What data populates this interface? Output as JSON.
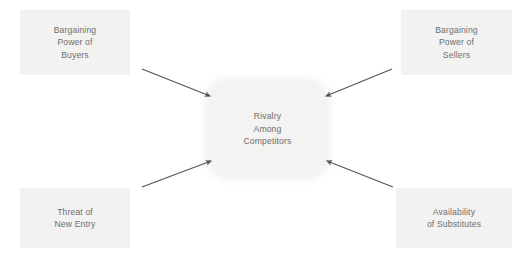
{
  "diagram": {
    "type": "porters-five-forces",
    "canvas": {
      "width": 532,
      "height": 255,
      "background": "#ffffff"
    },
    "colors": {
      "box_fill": "#f2f2f1",
      "center_fill": "#f3f3f2",
      "text": "#6e6e6e",
      "arrow": "#575757"
    },
    "center": {
      "label": "Rivalry\nAmong\nCompetitors"
    },
    "forces": [
      {
        "id": "bargaining-power-of-buyers",
        "label": "Bargaining\nPower of\nBuyers",
        "position": "top-left"
      },
      {
        "id": "bargaining-power-of-sellers",
        "label": "Bargaining\nPower of\nSellers",
        "position": "top-right"
      },
      {
        "id": "threat-of-new-entry",
        "label": "Threat of\nNew Entry",
        "position": "bottom-left"
      },
      {
        "id": "availability-of-substitutes",
        "label": "Availability\nof Substitutes",
        "position": "bottom-right"
      }
    ],
    "connectors": [
      {
        "id": "arrow-buyers-to-rivalry",
        "from": "bargaining-power-of-buyers",
        "to": "center",
        "direction": "down-right"
      },
      {
        "id": "arrow-sellers-to-rivalry",
        "from": "bargaining-power-of-sellers",
        "to": "center",
        "direction": "down-left"
      },
      {
        "id": "arrow-entry-to-rivalry",
        "from": "threat-of-new-entry",
        "to": "center",
        "direction": "up-right"
      },
      {
        "id": "arrow-substitutes-to-rivalry",
        "from": "availability-of-substitutes",
        "to": "center",
        "direction": "up-left"
      }
    ]
  }
}
